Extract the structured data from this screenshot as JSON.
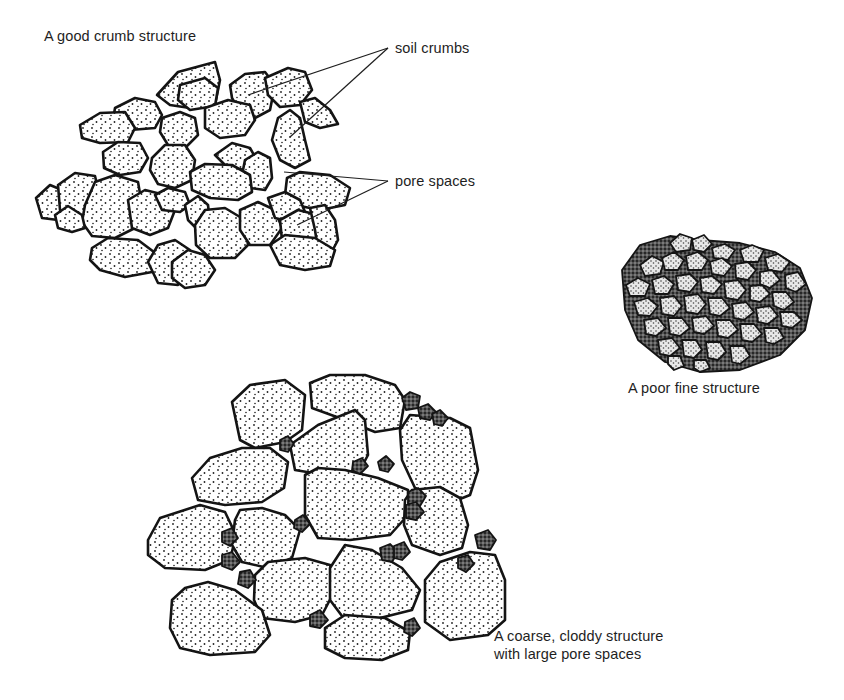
{
  "diagram": {
    "panels": [
      {
        "id": "good",
        "caption": "A good crumb structure"
      },
      {
        "id": "fine",
        "caption": "A poor fine structure"
      },
      {
        "id": "coarse",
        "caption_line1": "A coarse, cloddy structure",
        "caption_line2": "with large pore spaces"
      }
    ],
    "annotations": [
      {
        "id": "soil-crumbs",
        "text": "soil crumbs"
      },
      {
        "id": "pore-spaces",
        "text": "pore spaces"
      }
    ]
  },
  "colors": {
    "ink": "#141414",
    "paper": "#ffffff",
    "text": "#1e1e1e"
  }
}
